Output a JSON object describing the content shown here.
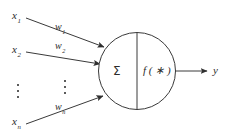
{
  "figure": {
    "type": "artificial-neuron-model",
    "background_color": "#ffffff",
    "stroke_color": "#3a3a3a",
    "text_color": "#2b2b2b"
  },
  "inputs": [
    {
      "base": "x",
      "subscript": "1",
      "weight_base": "w",
      "weight_subscript": "1"
    },
    {
      "base": "x",
      "subscript": "2",
      "weight_base": "w",
      "weight_subscript": "2"
    },
    {
      "base": "x",
      "subscript": "n",
      "weight_base": "w",
      "weight_subscript": "n"
    }
  ],
  "ellipses": {
    "input_column": "vertical-ellipsis",
    "weight_column": "vertical-ellipsis",
    "dot_count": 3
  },
  "neuron": {
    "summation_symbol": "Σ",
    "activation_label": "f ( ∗ )"
  },
  "output": {
    "base": "y"
  }
}
